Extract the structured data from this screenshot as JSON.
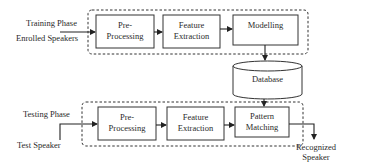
{
  "training": {
    "phase_label": "Training Phase",
    "input_label": "Enrolled Speakers",
    "blocks": [
      {
        "line1": "Pre-",
        "line2": "Processing"
      },
      {
        "line1": "Feature",
        "line2": "Extraction"
      },
      {
        "line1": "Modelling",
        "line2": ""
      }
    ]
  },
  "database": {
    "label": "Database"
  },
  "testing": {
    "phase_label": "Testing Phase",
    "input_label": "Test Speaker",
    "blocks": [
      {
        "line1": "Pre-",
        "line2": "Processing"
      },
      {
        "line1": "Feature",
        "line2": "Extraction"
      },
      {
        "line1": "Pattern",
        "line2": "Matching"
      }
    ],
    "output_line1": "Recognized",
    "output_line2": "Speaker"
  }
}
